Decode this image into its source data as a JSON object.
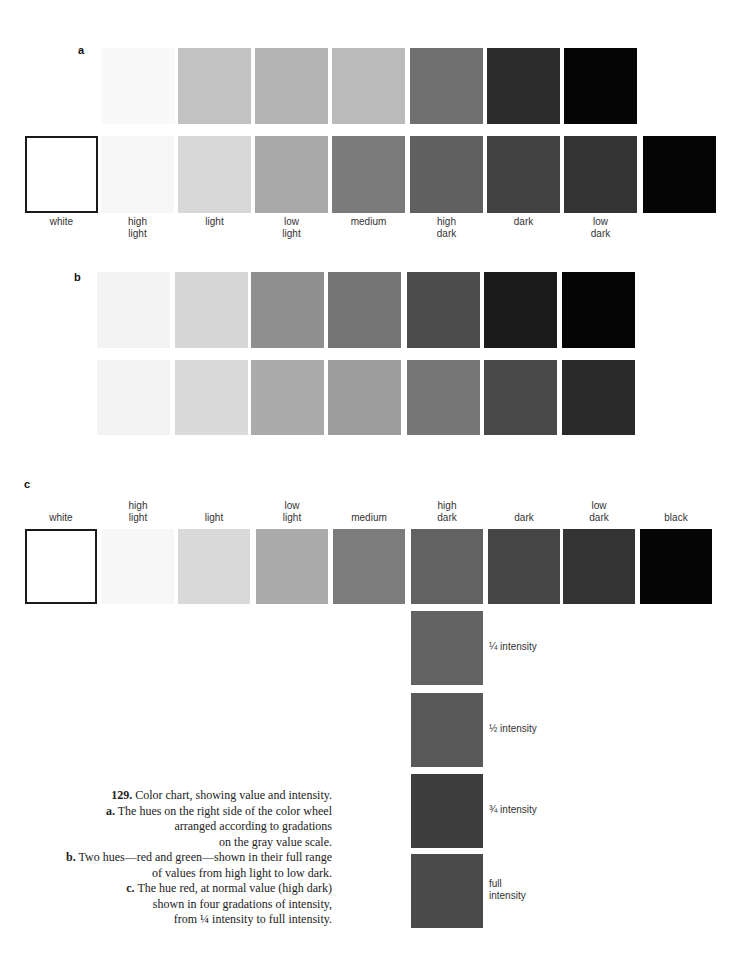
{
  "figure": {
    "panel_a": {
      "label": "a",
      "top_row": [
        {
          "color": "#f9f9f9"
        },
        {
          "color": "#c2c2c2"
        },
        {
          "color": "#b4b4b4"
        },
        {
          "color": "#bababa"
        },
        {
          "color": "#6f6f6f"
        },
        {
          "color": "#2b2b2b"
        },
        {
          "color": "#050505"
        }
      ],
      "bottom_row": [
        {
          "name": "white",
          "label": "white",
          "color": "#ffffff"
        },
        {
          "name": "high-light",
          "label": "high\nlight",
          "color": "#f6f6f6"
        },
        {
          "name": "light",
          "label": "light",
          "color": "#d8d8d8"
        },
        {
          "name": "low-light",
          "label": "low\nlight",
          "color": "#a8a8a8"
        },
        {
          "name": "medium",
          "label": "medium",
          "color": "#7b7b7b"
        },
        {
          "name": "high-dark",
          "label": "high\ndark",
          "color": "#606060"
        },
        {
          "name": "dark",
          "label": "dark",
          "color": "#424242"
        },
        {
          "name": "low-dark",
          "label": "low\ndark",
          "color": "#333333"
        },
        {
          "name": "black",
          "label": "",
          "color": "#050505"
        }
      ]
    },
    "panel_b": {
      "label": "b",
      "top_row": [
        {
          "color": "#f3f3f3"
        },
        {
          "color": "#d6d6d6"
        },
        {
          "color": "#8f8f8f"
        },
        {
          "color": "#747474"
        },
        {
          "color": "#4c4c4c"
        },
        {
          "color": "#1b1b1b"
        },
        {
          "color": "#050505"
        }
      ],
      "bottom_row": [
        {
          "color": "#f3f3f3"
        },
        {
          "color": "#dadada"
        },
        {
          "color": "#ababab"
        },
        {
          "color": "#9d9d9d"
        },
        {
          "color": "#767676"
        },
        {
          "color": "#494949"
        },
        {
          "color": "#2a2a2a"
        }
      ]
    },
    "panel_c": {
      "label": "c",
      "value_row": [
        {
          "name": "white",
          "label": "white",
          "color": "#ffffff"
        },
        {
          "name": "high-light",
          "label": "high\nlight",
          "color": "#f7f7f7"
        },
        {
          "name": "light",
          "label": "light",
          "color": "#d9d9d9"
        },
        {
          "name": "low-light",
          "label": "low\nlight",
          "color": "#ababab"
        },
        {
          "name": "medium",
          "label": "medium",
          "color": "#7c7c7c"
        },
        {
          "name": "high-dark",
          "label": "high\ndark",
          "color": "#626262"
        },
        {
          "name": "dark",
          "label": "dark",
          "color": "#454545"
        },
        {
          "name": "low-dark",
          "label": "low\ndark",
          "color": "#333333"
        },
        {
          "name": "black",
          "label": "black",
          "color": "#050505"
        }
      ],
      "intensity_column": [
        {
          "name": "quarter-intensity",
          "label": "¼ intensity",
          "color": "#636363"
        },
        {
          "name": "half-intensity",
          "label": "½ intensity",
          "color": "#595959"
        },
        {
          "name": "three-quarter-intensity",
          "label": "¾ intensity",
          "color": "#3e3e3e"
        },
        {
          "name": "full-intensity",
          "label": "full\nintensity",
          "color": "#4a4a4a"
        }
      ]
    },
    "caption": {
      "number": "129.",
      "title": " Color chart, showing value and intensity.",
      "a_key": "a.",
      "a_text": " The hues on the right side of the color wheel arranged according to gradations on the gray value scale.",
      "a_lines": [
        "The hues on the right side of the color wheel",
        "arranged according to gradations",
        "on the gray value scale."
      ],
      "b_key": "b.",
      "b_lines": [
        "Two hues—red and green—shown in their full range",
        "of values from high light to low dark."
      ],
      "c_key": "c.",
      "c_lines": [
        "The hue red, at normal value (high dark)",
        "shown in four gradations of intensity,",
        "from ¼ intensity to full intensity."
      ]
    }
  }
}
